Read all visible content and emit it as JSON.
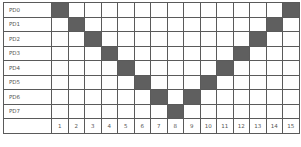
{
  "diagram": {
    "rows": [
      {
        "label": "PD0",
        "filled": [
          1,
          15
        ]
      },
      {
        "label": "PD1",
        "filled": [
          2,
          14
        ]
      },
      {
        "label": "PD2",
        "filled": [
          3,
          13
        ]
      },
      {
        "label": "PD3",
        "filled": [
          4,
          12
        ]
      },
      {
        "label": "PD4",
        "filled": [
          5,
          11
        ]
      },
      {
        "label": "PD5",
        "filled": [
          6,
          10
        ]
      },
      {
        "label": "PD6",
        "filled": [
          7,
          9
        ]
      },
      {
        "label": "PD7",
        "filled": [
          8
        ]
      }
    ],
    "columns": [
      "1",
      "2",
      "3",
      "4",
      "5",
      "6",
      "7",
      "8",
      "9",
      "10",
      "11",
      "12",
      "13",
      "14",
      "15"
    ],
    "colors": {
      "filled": "#5f5f5f",
      "empty": "#ffffff",
      "border": "#5a5a5a"
    }
  }
}
